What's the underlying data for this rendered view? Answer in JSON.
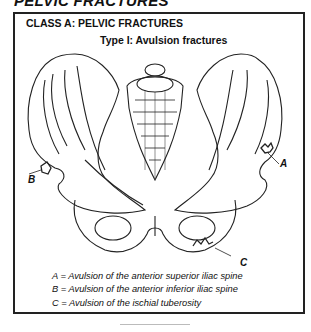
{
  "header": {
    "title": "PELVIC FRACTURES"
  },
  "panel": {
    "class_title": "CLASS A: PELVIC FRACTURES",
    "type_title": "Type I: Avulsion fractures"
  },
  "illustration": {
    "subject": "anterior view of pelvis",
    "labels": {
      "a": "A",
      "b": "B",
      "c": "C"
    }
  },
  "legend": [
    {
      "key": "A",
      "sep": "=",
      "text": "Avulsion of the anterior superior iliac spine"
    },
    {
      "key": "B",
      "sep": "=",
      "text": "Avulsion of the anterior inferior iliac spine"
    },
    {
      "key": "C",
      "sep": "=",
      "text": "Avulsion of the ischial tuberosity"
    }
  ]
}
